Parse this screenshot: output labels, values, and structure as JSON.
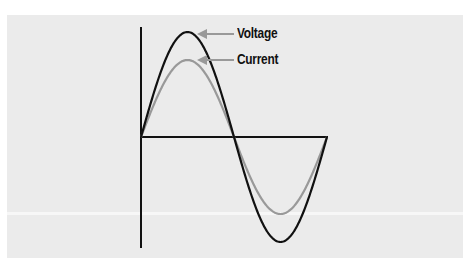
{
  "diagram": {
    "title": "",
    "type": "sine waveforms (AC voltage and current in phase)",
    "labels": {
      "voltage": "Voltage",
      "current": "Current"
    },
    "series": [
      {
        "name": "Voltage",
        "color": "#111111",
        "amplitude_px": 105
      },
      {
        "name": "Current",
        "color": "#999999",
        "amplitude_px": 77
      }
    ],
    "colors": {
      "background": "#ebebeb",
      "voltage": "#111111",
      "current": "#999999",
      "arrow": "#999999"
    }
  }
}
